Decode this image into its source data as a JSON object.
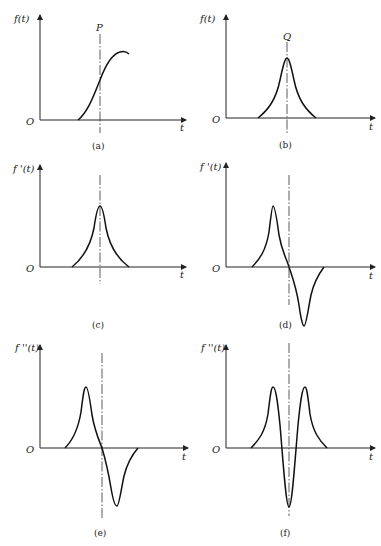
{
  "panels": [
    {
      "id": "a",
      "ylabel": "f(t)",
      "xlabel": "t",
      "origin": "O",
      "marker": "P",
      "caption": "(a)"
    },
    {
      "id": "b",
      "ylabel": "f(t)",
      "xlabel": "t",
      "origin": "O",
      "marker": "Q",
      "caption": "(b)"
    },
    {
      "id": "c",
      "ylabel": "f '(t)",
      "xlabel": "t",
      "origin": "O",
      "caption": "(c)"
    },
    {
      "id": "d",
      "ylabel": "f '(t)",
      "xlabel": "t",
      "origin": "O",
      "caption": "(d)"
    },
    {
      "id": "e",
      "ylabel": "f ''(t)",
      "xlabel": "t",
      "origin": "O",
      "caption": "(e)"
    },
    {
      "id": "f",
      "ylabel": "f ''(t)",
      "xlabel": "t",
      "origin": "O",
      "caption": "(f)"
    }
  ]
}
